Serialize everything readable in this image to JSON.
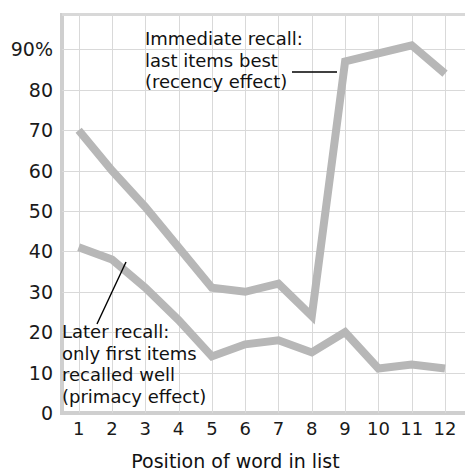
{
  "chart_data": {
    "type": "line",
    "title": "",
    "xlabel": "Position of word in list",
    "ylabel": "",
    "categories": [
      1,
      2,
      3,
      4,
      5,
      6,
      7,
      8,
      9,
      10,
      11,
      12
    ],
    "xtick_labels": [
      "1",
      "2",
      "3",
      "4",
      "5",
      "6",
      "7",
      "8",
      "9",
      "10",
      "11",
      "12"
    ],
    "ytick_labels": [
      "0",
      "10",
      "20",
      "30",
      "40",
      "50",
      "60",
      "70",
      "80",
      "90%"
    ],
    "ytick_values": [
      0,
      10,
      20,
      30,
      40,
      50,
      60,
      70,
      80,
      90
    ],
    "ylim": [
      0,
      99
    ],
    "xlim": [
      0.5,
      12.6
    ],
    "grid": true,
    "legend": "none",
    "series": [
      {
        "name": "Immediate recall",
        "values": [
          70,
          60,
          51,
          41,
          31,
          30,
          32,
          24,
          87,
          89,
          91,
          84
        ],
        "color": "#b7b7b7"
      },
      {
        "name": "Later recall",
        "values": [
          41,
          38,
          31,
          23,
          14,
          17,
          18,
          15,
          20,
          11,
          12,
          11
        ],
        "color": "#b7b7b7"
      }
    ],
    "annotations": [
      {
        "id": "recency",
        "text": "Immediate recall:\nlast items best\n(recency effect)",
        "points_to_series": "Immediate recall",
        "points_to_x": 9
      },
      {
        "id": "primacy",
        "text": "Later recall:\nonly first items\nrecalled well\n(primacy effect)",
        "points_to_series": "Later recall",
        "points_to_x": 2
      }
    ],
    "colors": {
      "line": "#b7b7b7",
      "grid": "#d9d9d9",
      "axis": "#cfcfcf",
      "text": "#111111",
      "background": "#ffffff",
      "leader": "#000000"
    }
  }
}
